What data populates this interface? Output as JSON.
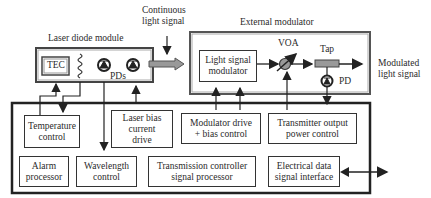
{
  "diagram": {
    "labels": {
      "laser_module": "Laser diode module",
      "continuous_light": "Continuous light signal",
      "continuous_light_l1": "Continuous",
      "continuous_light_l2": "light signal",
      "external_modulator": "External modulator",
      "voa": "VOA",
      "tap": "Tap",
      "pd": "PD",
      "pds": "PDs",
      "tec": "TEC",
      "modulated_l1": "Modulated",
      "modulated_l2": "light signal"
    },
    "blocks": {
      "light_signal_modulator": [
        "Light signal",
        "modulator"
      ],
      "temperature_control": [
        "Temperature",
        "control"
      ],
      "laser_bias": [
        "Laser bias",
        "current",
        "drive"
      ],
      "modulator_drive": [
        "Modulator drive",
        "+ bias control"
      ],
      "transmitter_output": [
        "Transmitter output",
        "power control"
      ],
      "alarm_processor": [
        "Alarm",
        "processor"
      ],
      "wavelength_control": [
        "Wavelength",
        "control"
      ],
      "transmission_controller": [
        "Transmission controller",
        "signal processor"
      ],
      "electrical_interface": [
        "Electrical data",
        "signal interface"
      ]
    },
    "colors": {
      "line": "#222222",
      "arrow_fill": "#999999",
      "tap_fill": "#999999"
    }
  }
}
